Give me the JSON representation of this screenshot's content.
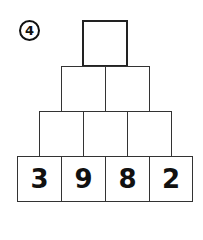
{
  "problem": {
    "number": "4"
  },
  "pyramid": {
    "top": [
      ""
    ],
    "row2": [
      "",
      ""
    ],
    "row3": [
      "",
      "",
      ""
    ],
    "base": [
      "3",
      "9",
      "8",
      "2"
    ]
  }
}
